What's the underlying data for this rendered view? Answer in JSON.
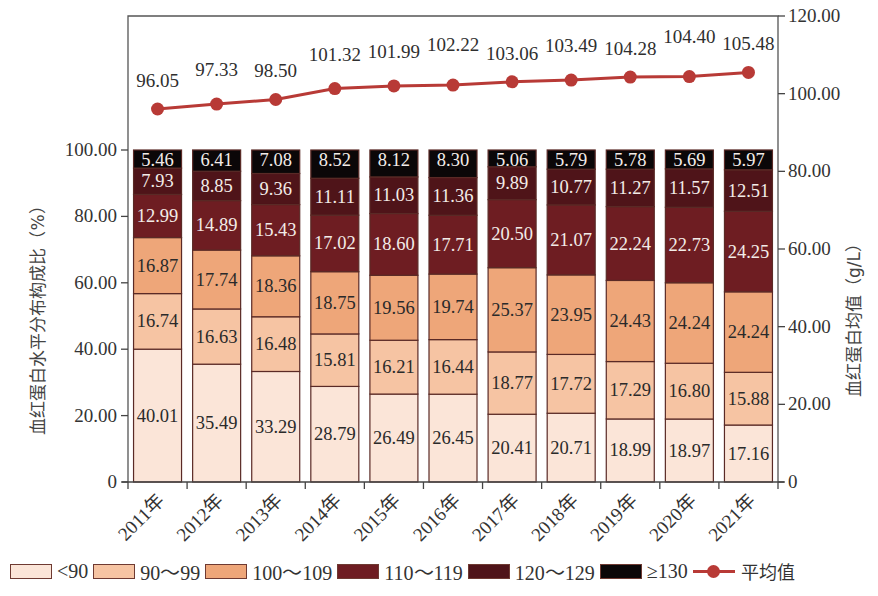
{
  "chart_data": {
    "type": "bar",
    "subtype": "stacked-bar-with-line-dual-axis",
    "categories": [
      "2011年",
      "2012年",
      "2013年",
      "2014年",
      "2015年",
      "2016年",
      "2017年",
      "2018年",
      "2019年",
      "2020年",
      "2021年"
    ],
    "series": [
      {
        "name": "<90",
        "type": "bar",
        "axis": "left",
        "color": "#fbe5d8",
        "values": [
          40.01,
          35.49,
          33.29,
          28.79,
          26.49,
          26.45,
          20.41,
          20.71,
          18.99,
          18.97,
          17.16
        ]
      },
      {
        "name": "90~99",
        "type": "bar",
        "axis": "left",
        "color": "#f6c4a3",
        "values": [
          16.74,
          16.63,
          16.48,
          15.81,
          16.21,
          16.44,
          18.77,
          17.72,
          17.29,
          16.8,
          15.88
        ]
      },
      {
        "name": "100~109",
        "type": "bar",
        "axis": "left",
        "color": "#eea679",
        "values": [
          16.87,
          17.74,
          18.36,
          18.75,
          19.56,
          19.74,
          25.37,
          23.95,
          24.43,
          24.24,
          24.24
        ]
      },
      {
        "name": "110~119",
        "type": "bar",
        "axis": "left",
        "color": "#6e1d22",
        "values": [
          12.99,
          14.89,
          15.43,
          17.02,
          18.6,
          17.71,
          20.5,
          21.07,
          22.24,
          22.73,
          24.25
        ]
      },
      {
        "name": "120~129",
        "type": "bar",
        "axis": "left",
        "color": "#4f1419",
        "values": [
          7.93,
          8.85,
          9.36,
          11.11,
          11.03,
          11.36,
          9.89,
          10.77,
          11.27,
          11.57,
          12.51
        ]
      },
      {
        "name": "≥130",
        "type": "bar",
        "axis": "left",
        "color": "#0b0708",
        "values": [
          5.46,
          6.41,
          7.08,
          8.52,
          8.12,
          8.3,
          5.06,
          5.79,
          5.78,
          5.69,
          5.97
        ]
      },
      {
        "name": "平均值",
        "type": "line",
        "axis": "right",
        "color": "#b83a36",
        "values": [
          96.05,
          97.33,
          98.5,
          101.32,
          101.99,
          102.22,
          103.06,
          103.49,
          104.28,
          104.4,
          105.48
        ]
      }
    ],
    "title": "",
    "xlabel": "",
    "ylabel": "血红蛋白水平分布构成比（%）",
    "ylabel_right": "血红蛋白均值（g/L）",
    "ylim": [
      0,
      100
    ],
    "ylim_right": [
      0,
      120
    ],
    "yticks": [
      "0",
      "20.00",
      "40.00",
      "60.00",
      "80.00",
      "100.00"
    ],
    "yticks_right": [
      "0",
      "20.00",
      "40.00",
      "60.00",
      "80.00",
      "100.00",
      "120.00"
    ],
    "grid": false,
    "legend_position": "bottom"
  },
  "legend": {
    "items": [
      {
        "label": "<90",
        "color": "#fbe5d8"
      },
      {
        "label": "90～99",
        "color": "#f6c4a3"
      },
      {
        "label": "100～109",
        "color": "#eea679"
      },
      {
        "label": "110～119",
        "color": "#6e1d22"
      },
      {
        "label": "120～129",
        "color": "#4f1419"
      },
      {
        "label": "≥130",
        "color": "#0b0708"
      }
    ],
    "line_label": "平均值"
  }
}
